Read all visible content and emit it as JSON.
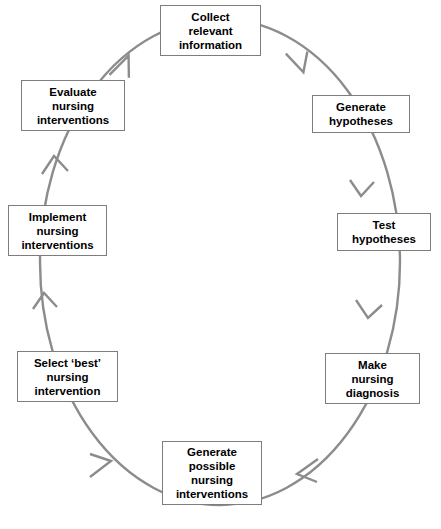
{
  "diagram": {
    "type": "cyclical-flow",
    "direction": "clockwise",
    "stroke_color": "#8c8c8c",
    "box_border_color": "#7d7d7d",
    "text_color": "#000000",
    "background_color": "#ffffff",
    "nodes": [
      {
        "id": "collect-relevant-information",
        "label": "Collect\nrelevant\ninformation",
        "position": "top",
        "order": 1
      },
      {
        "id": "generate-hypotheses",
        "label": "Generate\nhypotheses",
        "position": "upper-right",
        "order": 2
      },
      {
        "id": "test-hypotheses",
        "label": "Test\nhypotheses",
        "position": "right",
        "order": 3
      },
      {
        "id": "make-nursing-diagnosis",
        "label": "Make\nnursing\ndiagnosis",
        "position": "lower-right",
        "order": 4
      },
      {
        "id": "generate-possible-nursing-interventions",
        "label": "Generate\npossible\nnursing\ninterventions",
        "position": "bottom",
        "order": 5
      },
      {
        "id": "select-best-nursing-intervention",
        "label": "Select ‘best’\nnursing\nintervention",
        "position": "lower-left",
        "order": 6
      },
      {
        "id": "implement-nursing-interventions",
        "label": "Implement\nnursing\ninterventions",
        "position": "left",
        "order": 7
      },
      {
        "id": "evaluate-nursing-interventions",
        "label": "Evaluate\nnursing\ninterventions",
        "position": "upper-left",
        "order": 8
      }
    ]
  }
}
